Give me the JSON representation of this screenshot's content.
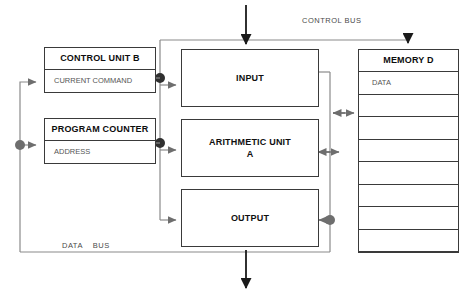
{
  "diagram": {
    "bus_labels": {
      "control_bus": "CONTROL BUS",
      "data_bus": "DATA    BUS"
    },
    "blocks": {
      "control_unit": {
        "title": "CONTROL  UNIT B",
        "sub": "CURRENT COMMAND"
      },
      "program_counter": {
        "title": "PROGRAM COUNTER",
        "sub": "ADDRESS"
      },
      "input": {
        "label": "INPUT"
      },
      "arithmetic_unit": {
        "label_line1": "ARITHMETIC UNIT",
        "label_line2": "A"
      },
      "output": {
        "label": "OUTPUT"
      },
      "memory": {
        "title": "MEMORY  D",
        "cells": [
          "DATA",
          "",
          "",
          "",
          "",
          "",
          "",
          "",
          ""
        ]
      }
    },
    "colors": {
      "box_border": "#3a3a3a",
      "bus_line": "#8a8a8a",
      "junction_dot": "#6e6e6e",
      "dark_junction_dot": "#303030",
      "arrow_gray": "#6e6e6e",
      "arrow_black": "#1a1a1a",
      "text_dark": "#101010",
      "text_gray": "#555555"
    }
  }
}
